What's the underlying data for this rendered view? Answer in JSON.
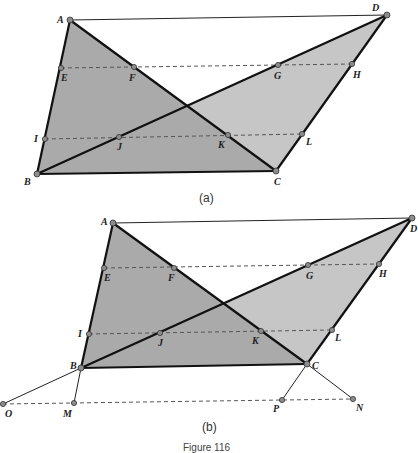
{
  "figure": {
    "caption": "Figure 116",
    "colors": {
      "triangle_abc_fill": "#a9a9a9",
      "triangle_bcd_fill": "#c4c4c4",
      "overlap_fill": "#9a9a9a",
      "stroke": "#1a1a1a",
      "dashed": "#555555",
      "point_fill": "#8c8c8c"
    }
  },
  "panel_a": {
    "label": "(a)",
    "points": {
      "A": "A",
      "B": "B",
      "C": "C",
      "D": "D",
      "E": "E",
      "F": "F",
      "G": "G",
      "H": "H",
      "I": "I",
      "J": "J",
      "K": "K",
      "L": "L"
    }
  },
  "panel_b": {
    "label": "(b)",
    "points": {
      "A": "A",
      "B": "B",
      "C": "C",
      "D": "D",
      "E": "E",
      "F": "F",
      "G": "G",
      "H": "H",
      "I": "I",
      "J": "J",
      "K": "K",
      "L": "L",
      "M": "M",
      "N": "N",
      "O": "O",
      "P": "P"
    }
  }
}
